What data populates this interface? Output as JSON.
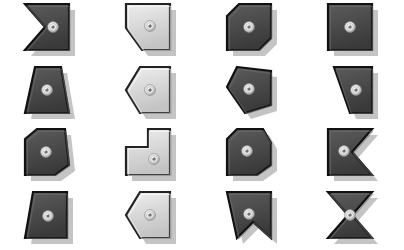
{
  "canvas": {
    "width": 404,
    "height": 250,
    "background": "#ffffff",
    "title": "Shape Tile Grid"
  },
  "palette": {
    "dark_fill": "#4a4a4a",
    "dark_fill_light": "#5c5c5c",
    "dark_fill_dark": "#3a3a3a",
    "light_fill": "#dcdcdc",
    "light_fill_light": "#eeeeee",
    "light_fill_dark": "#c4c4c4",
    "outline": "#111111",
    "outline_light": "#222222",
    "shadow": "#b0b0b0",
    "rivet_outer": "#9a9a9a",
    "rivet_mid": "#e8e8e8",
    "rivet_inner": "#6e6e6e",
    "rivet_highlight": "#ffffff"
  },
  "grid": {
    "columns": 4,
    "rows": 4,
    "cell_width": 101,
    "cell_height": 62.5
  },
  "tiles": [
    {
      "id": "tile-r1c1",
      "row": 1,
      "col": 1,
      "name": "chevron-notch-left",
      "shade": "dark",
      "width": 52,
      "height": 50,
      "points": "4,2 48,2 48,48 4,48 24,25",
      "rivet": {
        "cx": 32,
        "cy": 25
      }
    },
    {
      "id": "tile-r1c2",
      "row": 1,
      "col": 2,
      "name": "rect-bevel-bottom-left",
      "shade": "light",
      "width": 52,
      "height": 50,
      "points": "4,2 48,2 48,48 20,48 4,26",
      "rivet": {
        "cx": 28,
        "cy": 24
      }
    },
    {
      "id": "tile-r1c3",
      "row": 1,
      "col": 3,
      "name": "hexagon-bevel-tr-bl",
      "shade": "dark",
      "width": 52,
      "height": 50,
      "points": "4,14 16,2 48,2 48,36 36,48 4,48",
      "rivet": {
        "cx": 26,
        "cy": 25
      }
    },
    {
      "id": "tile-r1c4",
      "row": 1,
      "col": 4,
      "name": "square-plain",
      "shade": "dark",
      "width": 52,
      "height": 50,
      "points": "4,2 48,2 48,48 4,48",
      "rivet": {
        "cx": 26,
        "cy": 25
      }
    },
    {
      "id": "tile-r2c1",
      "row": 2,
      "col": 1,
      "name": "trapezoid-narrow-top",
      "shade": "dark",
      "width": 52,
      "height": 50,
      "points": "14,2 40,2 48,48 4,48",
      "rivet": {
        "cx": 26,
        "cy": 25
      }
    },
    {
      "id": "tile-r2c2",
      "row": 2,
      "col": 2,
      "name": "pentagon-point-left",
      "shade": "light",
      "width": 52,
      "height": 50,
      "points": "18,2 48,2 48,48 18,48 4,25",
      "rivet": {
        "cx": 28,
        "cy": 25
      }
    },
    {
      "id": "tile-r2c3",
      "row": 2,
      "col": 3,
      "name": "pentagon-slant-left",
      "shade": "dark",
      "width": 52,
      "height": 50,
      "points": "14,2 48,6 48,40 22,48 4,22",
      "rivet": {
        "cx": 26,
        "cy": 24
      }
    },
    {
      "id": "tile-r2c4",
      "row": 2,
      "col": 4,
      "name": "trapezoid-slant-left-edge",
      "shade": "dark",
      "width": 52,
      "height": 50,
      "points": "10,2 48,2 48,48 26,48",
      "rivet": {
        "cx": 32,
        "cy": 25
      }
    },
    {
      "id": "tile-r3c1",
      "row": 3,
      "col": 1,
      "name": "hexagon-bevel-tr-bl-wide",
      "shade": "dark",
      "width": 52,
      "height": 50,
      "points": "4,12 16,2 44,2 48,38 34,48 4,48",
      "rivet": {
        "cx": 25,
        "cy": 25
      }
    },
    {
      "id": "tile-r3c2",
      "row": 3,
      "col": 2,
      "name": "l-shape-mirrored",
      "shade": "light",
      "width": 52,
      "height": 50,
      "points": "26,2 48,2 48,48 4,48 4,20 26,20",
      "rivet": {
        "cx": 32,
        "cy": 32
      }
    },
    {
      "id": "tile-r3c3",
      "row": 3,
      "col": 3,
      "name": "hexagon-bevel-tr-bl-alt",
      "shade": "dark",
      "width": 52,
      "height": 50,
      "points": "4,12 14,2 40,2 48,16 48,38 34,48 4,48",
      "rivet": {
        "cx": 24,
        "cy": 24
      }
    },
    {
      "id": "tile-r3c4",
      "row": 3,
      "col": 4,
      "name": "chevron-notch-right",
      "shade": "dark",
      "width": 52,
      "height": 50,
      "points": "4,2 48,2 28,25 48,48 4,48",
      "rivet": {
        "cx": 20,
        "cy": 24
      }
    },
    {
      "id": "tile-r4c1",
      "row": 4,
      "col": 1,
      "name": "trapezoid-slant-left",
      "shade": "dark",
      "width": 52,
      "height": 50,
      "points": "12,2 46,2 46,48 4,48",
      "rivet": {
        "cx": 27,
        "cy": 26
      }
    },
    {
      "id": "tile-r4c2",
      "row": 4,
      "col": 2,
      "name": "pentagon-point-left-alt",
      "shade": "light",
      "width": 52,
      "height": 50,
      "points": "18,2 48,2 48,48 18,48 4,25",
      "rivet": {
        "cx": 28,
        "cy": 25
      }
    },
    {
      "id": "tile-r4c3",
      "row": 4,
      "col": 3,
      "name": "square-notch-bottom",
      "shade": "dark",
      "width": 52,
      "height": 50,
      "points": "4,2 48,2 48,48 30,32 14,48",
      "rivet": {
        "cx": 26,
        "cy": 24
      }
    },
    {
      "id": "tile-r4c4",
      "row": 4,
      "col": 4,
      "name": "bowtie-hourglass",
      "shade": "dark",
      "width": 52,
      "height": 50,
      "points": "4,2 48,2 28,25 48,48 4,48 24,25",
      "rivet": {
        "cx": 26,
        "cy": 25
      }
    }
  ]
}
